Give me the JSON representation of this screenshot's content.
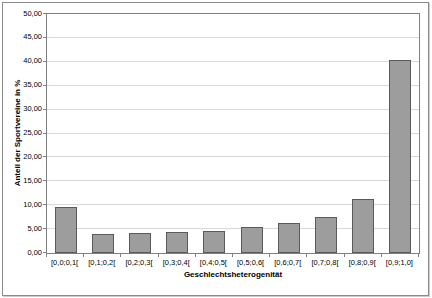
{
  "chart_data": {
    "type": "bar",
    "title": "",
    "xlabel": "Geschlechtsheterogenität",
    "ylabel": "Anteil der Sportvereine in %",
    "categories": [
      "[0,0;0,1[",
      "[0,1;0,2[",
      "[0,2;0,3[",
      "[0,3;0,4[",
      "[0,4;0,5[",
      "[0,5;0,6[",
      "[0,6;0,7[",
      "[0,7;0,8[",
      "[0,8;0,9[",
      "[0,9;1,0]"
    ],
    "values": [
      9.6,
      3.9,
      4.2,
      4.4,
      4.6,
      5.4,
      6.3,
      7.6,
      11.3,
      40.4
    ],
    "ylim": [
      0,
      50
    ],
    "ytick_step": 5,
    "ytick_labels": [
      "0,00",
      "5,00",
      "10,00",
      "15,00",
      "20,00",
      "25,00",
      "30,00",
      "35,00",
      "40,00",
      "45,00",
      "50,00"
    ],
    "grid": true,
    "legend": "none",
    "bar_color": "#9d9d9d",
    "bar_border_color": "#5a5a5a",
    "gridline_color": "#d9d9d9",
    "axis_color": "#808080"
  }
}
